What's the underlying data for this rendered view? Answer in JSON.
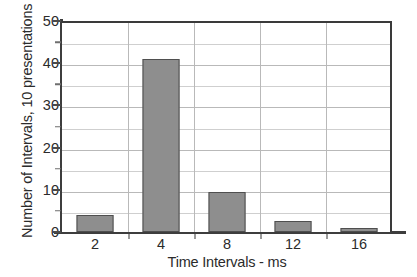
{
  "chart_data": {
    "type": "bar",
    "title": "",
    "xlabel": "Time Intervals - ms",
    "ylabel": "Number of Intervals, 10 presentations",
    "categories": [
      "2",
      "4",
      "8",
      "12",
      "16"
    ],
    "values": [
      4,
      41,
      9.5,
      2.5,
      1
    ],
    "series": [
      {
        "name": "Number of Intervals",
        "values": [
          4,
          41,
          9.5,
          2.5,
          1
        ]
      }
    ],
    "ylim": [
      0,
      50
    ],
    "yticks": [
      0,
      10,
      20,
      30,
      40,
      50
    ],
    "ytick_labels": [
      "0",
      "10",
      "20",
      "30",
      "40",
      "50"
    ],
    "yminor_ticks": [
      5,
      15,
      25,
      35,
      45
    ],
    "grid": "horizontal-and-vertical",
    "legend": "none",
    "bar_fill_color": "#8e8e8e",
    "bar_edge_color": "#4f4f4f",
    "grid_color": "#b9b9b9",
    "axis_color": "#3d3d3d",
    "background_color": "#ffffff",
    "text_color": "#2b2b2b"
  }
}
